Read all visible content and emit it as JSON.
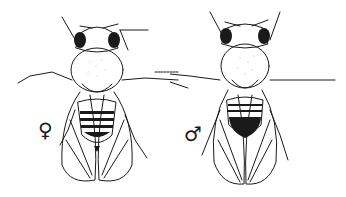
{
  "figure": {
    "colors": {
      "ink": "#1a1a1a",
      "background": "#ffffff"
    }
  },
  "female": {
    "label": "female fly",
    "symbol": "♀"
  },
  "male": {
    "label": "male fly",
    "symbol": "♂"
  }
}
